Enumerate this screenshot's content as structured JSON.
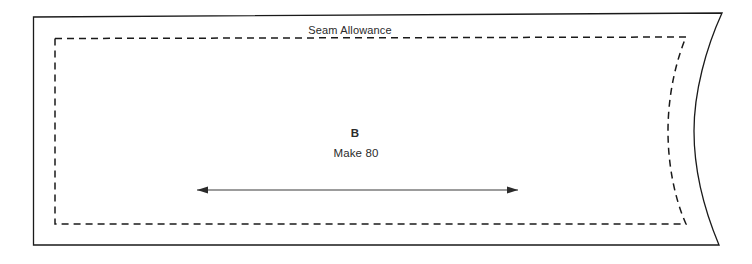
{
  "sheet": {
    "width": 752,
    "height": 264,
    "background_color": "#ffffff"
  },
  "pattern_piece": {
    "piece_letter": "B",
    "make_quantity_label": "Make 80",
    "seam_allowance_label": "Seam Allowance",
    "cut_line": {
      "name": "cutting-line",
      "style": "solid",
      "color": "#1a1a1a",
      "stroke_width": 1.3,
      "path": "M 33.5 17 L 722 13 C 706 48, 694 92, 694 131 C 694 173, 706 214, 719 245 L 33.5 245 Z"
    },
    "stitch_line": {
      "name": "stitching-line",
      "style": "dashed",
      "color": "#1a1a1a",
      "stroke_width": 1.5,
      "dash_length": 7,
      "gap_length": 5,
      "path": "M 55 38.5 L 686 37 C 674 66, 668 100, 668 131 C 668 163, 674 197, 686 224 L 55 224 Z"
    },
    "grainline_arrow": {
      "name": "grainline-arrow",
      "color": "#3a3a3a",
      "stroke_width": 1.1,
      "y": 190,
      "x_start": 197,
      "x_end": 518,
      "double_headed": true,
      "arrowhead_length": 11,
      "arrowhead_half_width": 3.6
    },
    "text_positions": {
      "seam_allowance": {
        "x": 350,
        "y": 34
      },
      "piece_letter": {
        "x": 355,
        "y": 137
      },
      "make_quantity": {
        "x": 356,
        "y": 157
      }
    }
  }
}
